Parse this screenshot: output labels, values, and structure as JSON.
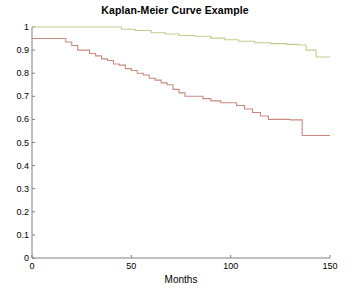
{
  "chart_data": {
    "type": "line",
    "title": "Kaplan-Meier Curve Example",
    "xlabel": "Months",
    "ylabel": "",
    "xlim": [
      0,
      150
    ],
    "ylim": [
      0,
      1
    ],
    "xticks": [
      0,
      50,
      100,
      150
    ],
    "xticklabels": [
      "0",
      "50",
      "100",
      "150"
    ],
    "yticks": [
      0,
      0.1,
      0.2,
      0.3,
      0.4,
      0.5,
      0.6,
      0.7,
      0.8,
      0.9,
      1
    ],
    "yticklabels": [
      "0",
      "0.1",
      "0.2",
      "0.3",
      "0.4",
      "0.5",
      "0.6",
      "0.7",
      "0.8",
      "0.9",
      "1"
    ],
    "grid": false,
    "legend": "none",
    "step_style": "post",
    "series": [
      {
        "name": "upper-survival-curve",
        "color": "#c5cc8e",
        "x": [
          0,
          38,
          45,
          52,
          60,
          67,
          74,
          82,
          90,
          97,
          104,
          112,
          120,
          128,
          134,
          138,
          143,
          150
        ],
        "y": [
          1.0,
          1.0,
          0.99,
          0.985,
          0.975,
          0.97,
          0.963,
          0.96,
          0.952,
          0.945,
          0.938,
          0.932,
          0.928,
          0.925,
          0.922,
          0.9,
          0.87,
          0.87
        ]
      },
      {
        "name": "lower-survival-curve",
        "color": "#c98b80",
        "x": [
          0,
          14,
          17,
          20,
          23,
          26,
          29,
          32,
          35,
          38,
          41,
          44,
          47,
          50,
          53,
          56,
          59,
          62,
          65,
          68,
          71,
          74,
          77,
          82,
          86,
          90,
          95,
          99,
          103,
          107,
          111,
          115,
          119,
          125,
          130,
          136,
          150
        ],
        "y": [
          0.95,
          0.95,
          0.935,
          0.92,
          0.9,
          0.9,
          0.885,
          0.875,
          0.862,
          0.855,
          0.84,
          0.835,
          0.82,
          0.812,
          0.8,
          0.792,
          0.778,
          0.77,
          0.758,
          0.75,
          0.73,
          0.715,
          0.7,
          0.7,
          0.69,
          0.68,
          0.672,
          0.672,
          0.66,
          0.645,
          0.63,
          0.615,
          0.6,
          0.6,
          0.598,
          0.53,
          0.53
        ]
      }
    ]
  },
  "axis_color": "#808080",
  "background": "#ffffff"
}
